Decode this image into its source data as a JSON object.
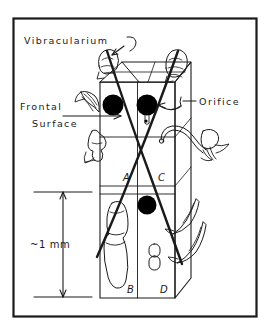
{
  "figure": {
    "background_color": "#ffffff",
    "ink_color": "#1a1a1a",
    "frame": {
      "name": "figure-border",
      "x": 13,
      "y": 18,
      "width": 244,
      "height": 299,
      "stroke_width": 2.2
    }
  },
  "labels": {
    "vibracularium": "Vibracularium",
    "frontal_line1": "Frontal",
    "frontal_line2": "Surface",
    "orifice": "Orifice"
  },
  "cells": [
    {
      "id": "cell-a",
      "label": "A",
      "x": 123,
      "y": 181
    },
    {
      "id": "cell-c",
      "label": "C",
      "x": 158,
      "y": 181
    },
    {
      "id": "cell-b",
      "label": "B",
      "x": 127,
      "y": 293
    },
    {
      "id": "cell-d",
      "label": "D",
      "x": 160,
      "y": 293
    }
  ],
  "scale_bar": {
    "label": "~1 mm",
    "top_y": 192,
    "bottom_y": 297,
    "arrow_x": 63,
    "tick_left_x": 34,
    "tick_right_x": 92,
    "label_x": 30,
    "label_y": 248
  },
  "structures": {
    "orifices": [
      {
        "name": "orifice-left-front",
        "cx": 113,
        "cy": 105,
        "r": 10.5
      },
      {
        "name": "orifice-right-front",
        "cx": 147,
        "cy": 105,
        "r": 10.5
      },
      {
        "name": "orifice-lower-front",
        "cx": 147,
        "cy": 205,
        "r": 9.5
      }
    ],
    "vibracula_count": 2,
    "setae_count": 2,
    "avicularia_count": 4,
    "ovicell_present": true,
    "polypide_present": true
  }
}
